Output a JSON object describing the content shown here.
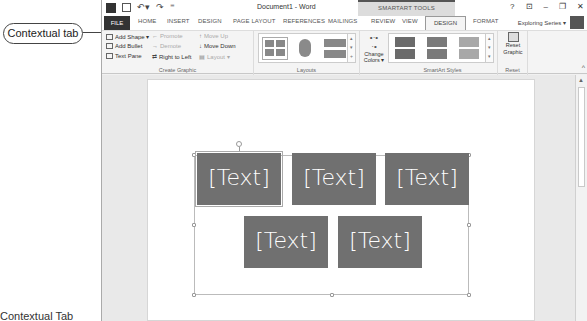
{
  "callout": {
    "label": "Contextual tab"
  },
  "caption": {
    "text": "Contextual Tab"
  },
  "titlebar": {
    "title": "Document1 - Word",
    "contextual_group": "SMARTART TOOLS",
    "undo_glyph": "↶▾",
    "redo_glyph": "↷",
    "qat_more": "⁼",
    "controls": {
      "help": "?",
      "ribbon_options": "⊡",
      "minimize": "–",
      "restore": "❐",
      "close": "✕"
    }
  },
  "tabs": {
    "items": [
      {
        "label": "FILE"
      },
      {
        "label": "HOME"
      },
      {
        "label": "INSERT"
      },
      {
        "label": "DESIGN"
      },
      {
        "label": "PAGE LAYOUT"
      },
      {
        "label": "REFERENCES"
      },
      {
        "label": "MAILINGS"
      },
      {
        "label": "REVIEW"
      },
      {
        "label": "VIEW"
      },
      {
        "label": "DESIGN",
        "active": true,
        "contextual": true
      },
      {
        "label": "FORMAT",
        "contextual": true
      }
    ],
    "account": "Exploring Series ▾"
  },
  "ribbon": {
    "create_graphic": {
      "label": "Create Graphic",
      "add_shape": "Add Shape ▾",
      "add_bullet": "Add Bullet",
      "text_pane": "Text Pane",
      "promote": "Promote",
      "demote": "Demote",
      "right_to_left": "Right to Left",
      "move_up": "Move Up",
      "move_down": "Move Down",
      "layout": "Layout ▾"
    },
    "layouts": {
      "label": "Layouts"
    },
    "change_colors": {
      "label_line1": "Change",
      "label_line2": "Colors ▾"
    },
    "smartart_styles": {
      "label": "SmartArt Styles",
      "style_colors": [
        "#6b6b6b",
        "#7a7a7a",
        "#a8a8a8"
      ]
    },
    "reset": {
      "label": "Reset",
      "button_line1": "Reset",
      "button_line2": "Graphic"
    },
    "collapse_glyph": "^"
  },
  "smartart": {
    "box_color": "#707070",
    "shapes": [
      {
        "text": "[Text]",
        "selected": true
      },
      {
        "text": "[Text]"
      },
      {
        "text": "[Text]"
      },
      {
        "text": "[Text]"
      },
      {
        "text": "[Text]"
      }
    ]
  },
  "scrollbar": {
    "up_glyph": "▲"
  }
}
